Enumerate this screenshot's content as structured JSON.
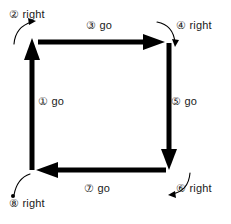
{
  "diagram": {
    "type": "square-path-traversal",
    "stroke_color": "#000000",
    "background_color": "#ffffff",
    "label_color": "#1a1a1a",
    "steps": [
      {
        "id": 1,
        "marker": "①",
        "action": "go",
        "label": "① go",
        "direction": "up",
        "kind": "segment"
      },
      {
        "id": 2,
        "marker": "②",
        "action": "right",
        "label": "② right",
        "direction": "turn",
        "kind": "turn"
      },
      {
        "id": 3,
        "marker": "③",
        "action": "go",
        "label": "③ go",
        "direction": "right",
        "kind": "segment"
      },
      {
        "id": 4,
        "marker": "④",
        "action": "right",
        "label": "④ right",
        "direction": "turn",
        "kind": "turn"
      },
      {
        "id": 5,
        "marker": "⑤",
        "action": "go",
        "label": "⑤ go",
        "direction": "down",
        "kind": "segment"
      },
      {
        "id": 6,
        "marker": "⑥",
        "action": "right",
        "label": "⑥ right",
        "direction": "turn",
        "kind": "turn"
      },
      {
        "id": 7,
        "marker": "⑦",
        "action": "go",
        "label": "⑦ go",
        "direction": "left",
        "kind": "segment"
      },
      {
        "id": 8,
        "marker": "⑧",
        "action": "right",
        "label": "⑧ right",
        "direction": "turn",
        "kind": "turn"
      }
    ]
  }
}
